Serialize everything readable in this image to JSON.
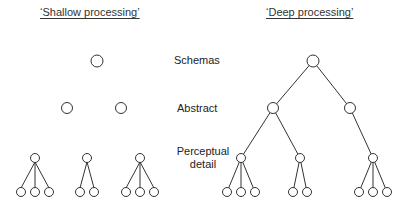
{
  "diagram": {
    "titles": {
      "shallow": "‘Shallow processing’",
      "deep": "‘Deep processing’"
    },
    "levels": {
      "schemas": "Schemas",
      "abstract": "Abstract",
      "perceptual_line1": "Perceptual",
      "perceptual_line2": "detail"
    },
    "colors": {
      "stroke": "#333333",
      "background": "#ffffff"
    },
    "shallow_structure": {
      "schema_nodes": 1,
      "abstract_nodes": 2,
      "perceptual_clusters": [
        3,
        2,
        3
      ],
      "connected_across_levels": false
    },
    "deep_structure": {
      "schema_nodes": 1,
      "abstract_nodes": 2,
      "perceptual_clusters": [
        3,
        2,
        3
      ],
      "connected_across_levels": true
    }
  }
}
